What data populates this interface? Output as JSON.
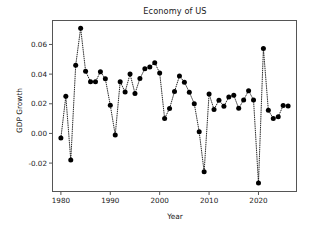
{
  "chart_data": {
    "type": "scatter",
    "title": "Economy of US",
    "xlabel": "Year",
    "ylabel": "GDP Growth",
    "grid": false,
    "legend": null,
    "marker": "filled-circle",
    "linestyle": "dotted",
    "color": "#000000",
    "xlim": [
      1978.2,
      2027.8
    ],
    "ylim": [
      -0.0395,
      0.0765
    ],
    "xticks": [
      1980,
      1990,
      2000,
      2010,
      2020
    ],
    "xtick_labels": [
      "1980",
      "1990",
      "2000",
      "2010",
      "2020"
    ],
    "yticks": [
      -0.02,
      0.0,
      0.02,
      0.04,
      0.06
    ],
    "ytick_labels": [
      "-0.02",
      "0.00",
      "0.02",
      "0.04",
      "0.06"
    ],
    "x": [
      1980,
      1981,
      1982,
      1983,
      1984,
      1985,
      1986,
      1987,
      1988,
      1989,
      1990,
      1991,
      1992,
      1993,
      1994,
      1995,
      1996,
      1997,
      1998,
      1999,
      2000,
      2001,
      2002,
      2003,
      2004,
      2005,
      2006,
      2007,
      2008,
      2009,
      2010,
      2011,
      2012,
      2013,
      2014,
      2015,
      2016,
      2017,
      2018,
      2019,
      2020,
      2021,
      2022,
      2023,
      2024,
      2025,
      2026
    ],
    "y": [
      -0.003,
      0.025,
      -0.018,
      0.046,
      0.071,
      0.042,
      0.0348,
      0.0348,
      0.0416,
      0.0368,
      0.019,
      -0.001,
      0.0348,
      0.028,
      0.04,
      0.027,
      0.037,
      0.0437,
      0.0448,
      0.0477,
      0.0408,
      0.0101,
      0.0168,
      0.0282,
      0.0387,
      0.0346,
      0.0278,
      0.0201,
      0.0011,
      -0.0259,
      0.0266,
      0.0162,
      0.0224,
      0.0184,
      0.0245,
      0.0257,
      0.0169,
      0.0226,
      0.0288,
      0.0226,
      -0.0334,
      0.0572,
      0.0156,
      0.0101,
      0.0112,
      0.0188,
      0.0185
    ]
  },
  "axes": {
    "frame": {
      "left_px": 52,
      "right_px": 297,
      "top_px": 20,
      "bottom_px": 192
    }
  }
}
